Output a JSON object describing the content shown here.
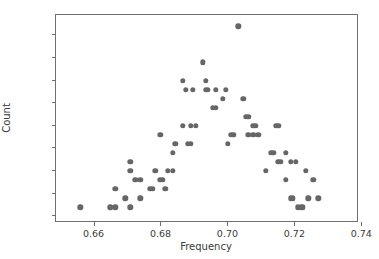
{
  "chart_data": {
    "type": "scatter",
    "title": "",
    "xlabel": "Frequency",
    "ylabel": "Count",
    "xlim": [
      0.6485,
      0.739
    ],
    "ylim": [
      -0.75,
      22.25
    ],
    "grid": false,
    "legend": null,
    "marker": {
      "color": "#666666",
      "shape": "circle",
      "size": 5.4
    },
    "xticks": [
      0.66,
      0.68,
      0.7,
      0.72,
      0.74
    ],
    "xtick_labels": [
      "0.66",
      "0.68",
      "0.70",
      "0.72",
      "0.74"
    ],
    "yticks": [
      0.0,
      2.5,
      5.0,
      7.5,
      10.0,
      12.5,
      15.0,
      17.5,
      20.0
    ],
    "ytick_labels": [
      "0.0",
      "2.5",
      "5.0",
      "7.5",
      "10.0",
      "12.5",
      "15.0",
      "17.5",
      "20.0"
    ],
    "points": [
      {
        "x": 0.6558,
        "y": 1
      },
      {
        "x": 0.6647,
        "y": 1
      },
      {
        "x": 0.6662,
        "y": 1
      },
      {
        "x": 0.6662,
        "y": 3
      },
      {
        "x": 0.6692,
        "y": 2
      },
      {
        "x": 0.6707,
        "y": 1
      },
      {
        "x": 0.6707,
        "y": 5
      },
      {
        "x": 0.6707,
        "y": 6
      },
      {
        "x": 0.6722,
        "y": 4
      },
      {
        "x": 0.6737,
        "y": 4
      },
      {
        "x": 0.6737,
        "y": 2
      },
      {
        "x": 0.6767,
        "y": 3
      },
      {
        "x": 0.6774,
        "y": 3
      },
      {
        "x": 0.6782,
        "y": 5
      },
      {
        "x": 0.6797,
        "y": 9
      },
      {
        "x": 0.6797,
        "y": 4
      },
      {
        "x": 0.6804,
        "y": 4
      },
      {
        "x": 0.6812,
        "y": 3
      },
      {
        "x": 0.6819,
        "y": 5
      },
      {
        "x": 0.6834,
        "y": 5
      },
      {
        "x": 0.6834,
        "y": 7
      },
      {
        "x": 0.6841,
        "y": 8
      },
      {
        "x": 0.6864,
        "y": 15
      },
      {
        "x": 0.6864,
        "y": 10
      },
      {
        "x": 0.6872,
        "y": 14
      },
      {
        "x": 0.6879,
        "y": 8
      },
      {
        "x": 0.6887,
        "y": 8
      },
      {
        "x": 0.6887,
        "y": 10
      },
      {
        "x": 0.6894,
        "y": 14
      },
      {
        "x": 0.6902,
        "y": 10
      },
      {
        "x": 0.6924,
        "y": 17
      },
      {
        "x": 0.6932,
        "y": 15
      },
      {
        "x": 0.6932,
        "y": 14
      },
      {
        "x": 0.6939,
        "y": 14
      },
      {
        "x": 0.6954,
        "y": 12
      },
      {
        "x": 0.6962,
        "y": 12
      },
      {
        "x": 0.6962,
        "y": 14
      },
      {
        "x": 0.6984,
        "y": 13
      },
      {
        "x": 0.6992,
        "y": 14
      },
      {
        "x": 0.6999,
        "y": 8
      },
      {
        "x": 0.7007,
        "y": 9
      },
      {
        "x": 0.7014,
        "y": 9
      },
      {
        "x": 0.7029,
        "y": 21
      },
      {
        "x": 0.7044,
        "y": 13
      },
      {
        "x": 0.7052,
        "y": 11
      },
      {
        "x": 0.7059,
        "y": 11
      },
      {
        "x": 0.7059,
        "y": 9
      },
      {
        "x": 0.7074,
        "y": 10
      },
      {
        "x": 0.7074,
        "y": 9
      },
      {
        "x": 0.7081,
        "y": 10
      },
      {
        "x": 0.7089,
        "y": 9
      },
      {
        "x": 0.7111,
        "y": 5
      },
      {
        "x": 0.7126,
        "y": 7
      },
      {
        "x": 0.7134,
        "y": 7
      },
      {
        "x": 0.7141,
        "y": 10
      },
      {
        "x": 0.7149,
        "y": 10
      },
      {
        "x": 0.7149,
        "y": 6
      },
      {
        "x": 0.7156,
        "y": 6
      },
      {
        "x": 0.7171,
        "y": 4
      },
      {
        "x": 0.7171,
        "y": 7
      },
      {
        "x": 0.7186,
        "y": 6
      },
      {
        "x": 0.7186,
        "y": 2
      },
      {
        "x": 0.7193,
        "y": 2
      },
      {
        "x": 0.7201,
        "y": 6
      },
      {
        "x": 0.7208,
        "y": 1
      },
      {
        "x": 0.7216,
        "y": 1
      },
      {
        "x": 0.7223,
        "y": 1
      },
      {
        "x": 0.7231,
        "y": 5
      },
      {
        "x": 0.7238,
        "y": 2
      },
      {
        "x": 0.7253,
        "y": 4
      },
      {
        "x": 0.7268,
        "y": 2
      }
    ]
  }
}
